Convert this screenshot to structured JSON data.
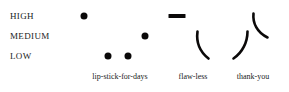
{
  "chart_data": {
    "type": "scatter",
    "title": "",
    "xlabel": "",
    "ylabel": "",
    "grid": false,
    "legend": null,
    "y_categories": [
      "HIGH",
      "MEDIUM",
      "LOW"
    ],
    "categories": [
      "lip-stick-for-days",
      "flaw-less",
      "thank-you"
    ],
    "series": [
      {
        "name": "lip-stick-for-days",
        "marks": [
          {
            "kind": "dot",
            "level": "HIGH",
            "x": 84,
            "y": 16,
            "size": 7
          },
          {
            "kind": "dot",
            "level": "MEDIUM",
            "x": 145,
            "y": 36,
            "size": 7
          },
          {
            "kind": "dot",
            "level": "LOW",
            "x": 108,
            "y": 56,
            "size": 7
          },
          {
            "kind": "dot",
            "level": "LOW",
            "x": 128,
            "y": 56,
            "size": 7
          }
        ]
      },
      {
        "name": "flaw-less",
        "marks": [
          {
            "kind": "dash",
            "level": "HIGH",
            "x": 177,
            "y": 16,
            "width": 17,
            "height": 4
          },
          {
            "kind": "curve",
            "level": "MEDIUM-to-LOW",
            "path": "M 197.5 31.5 C 196.2 41.5 199.5 51.5 208.5 58.5",
            "width": 2.6
          }
        ]
      },
      {
        "name": "thank-you",
        "marks": [
          {
            "kind": "curve",
            "level": "MEDIUM-to-LOW",
            "path": "M 247.5 31.5 C 247.5 42.0 242.5 52.5 233.5 58.5",
            "width": 2.6
          },
          {
            "kind": "curve",
            "level": "HIGH-to-MEDIUM",
            "path": "M 253.5 13.5 C 252.5 23.0 257.0 32.5 267.5 37.5",
            "width": 2.6
          }
        ]
      }
    ],
    "y_positions": {
      "HIGH": 16,
      "MEDIUM": 36,
      "LOW": 56
    },
    "x_label_positions": [
      {
        "label": "lip-stick-for-days",
        "x": 120,
        "y": 72
      },
      {
        "label": "flaw-less",
        "x": 193,
        "y": 72
      },
      {
        "label": "thank-you",
        "x": 253,
        "y": 72
      }
    ],
    "colors": {
      "mark": "#0b0909",
      "text": "#201c1c",
      "background": "#ffffff"
    }
  }
}
